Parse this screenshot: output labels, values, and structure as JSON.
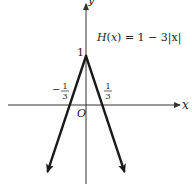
{
  "chart_data": {
    "type": "line",
    "title": "H(x) = 1 − 3|x|",
    "function_label": {
      "name": "H",
      "arg": "x",
      "expression": "= 1 − 3|x|"
    },
    "xlabel": "x",
    "ylabel": "y",
    "origin_label": "O",
    "xlim": [
      -1.5,
      1.85
    ],
    "ylim": [
      -2.6,
      1.1
    ],
    "grid": false,
    "series": [
      {
        "name": "H(x) = 1 − 3|x|",
        "x": [
          -0.75,
          0,
          0.75
        ],
        "y": [
          -1.35,
          1,
          -1.35
        ],
        "end_arrows": true
      }
    ],
    "tick_labels": {
      "y": [
        {
          "value": 1,
          "text": "1"
        }
      ],
      "x": [
        {
          "value": -0.3333,
          "sign": "−",
          "numerator": "1",
          "denominator": "3"
        },
        {
          "value": 0.3333,
          "sign": "",
          "numerator": "1",
          "denominator": "3"
        }
      ]
    },
    "colors": {
      "axis": "#333333",
      "curve": "#1a1a1a",
      "text": "#222222"
    }
  }
}
